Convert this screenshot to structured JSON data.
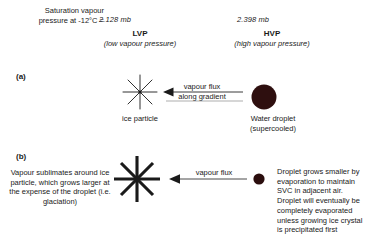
{
  "header": {
    "saturation_label": "Saturation vapour pressure at -12°C =",
    "lvp": {
      "value": "2.128 mb",
      "abbr": "LVP",
      "expansion": "(low vapour pressure)"
    },
    "hvp": {
      "value": "2.398 mb",
      "abbr": "HVP",
      "expansion": "(high vapour pressure)"
    }
  },
  "panels": [
    {
      "letter": "(a)",
      "left_caption": "ice particle",
      "right_caption": "Water droplet (supercooled)",
      "arrow_label_line1": "vapour flux",
      "arrow_label_line2": "along gradient",
      "left_icon": "ice-crystal-icon",
      "right_icon": "water-droplet-icon"
    },
    {
      "letter": "(b)",
      "left_text": "Vapour sublimates around ice particle, which grows larger at the expense of the droplet (i.e. glaciation)",
      "right_text": "Droplet grows smaller by evaporation  to maintain SVC in adjacent air. Droplet will eventually be completely evaporated unless growing ice crystal is precipitated first",
      "arrow_label_line1": "vapour flux",
      "left_icon": "ice-crystal-icon",
      "right_icon": "water-droplet-icon"
    }
  ],
  "colors": {
    "text": "#1a1a1a",
    "droplet": "#2e0f0f",
    "arrow": "#3a3a3a",
    "crystal": "#1a1a1a"
  }
}
